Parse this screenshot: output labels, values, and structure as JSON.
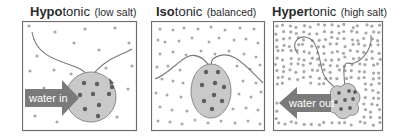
{
  "panels": [
    {
      "id": "hypotonic",
      "title_bold": "Hypo",
      "title_rest": "tonic",
      "subtitle": "(low salt)",
      "arrow_label": "water in",
      "arrow_direction": "into-cell"
    },
    {
      "id": "isotonic",
      "title_bold": "Iso",
      "title_rest": "tonic",
      "subtitle": "(balanced)",
      "arrow_label": "",
      "arrow_direction": "none"
    },
    {
      "id": "hypertonic",
      "title_bold": "Hyper",
      "title_rest": "tonic",
      "subtitle": "(high salt)",
      "arrow_label": "water out",
      "arrow_direction": "out-of-cell"
    }
  ],
  "colors": {
    "border": "#6d6d6d",
    "cell_fill": "#c9c9c9",
    "cell_stroke": "#8a8a8a",
    "salt_dot": "#a9a9a9",
    "cell_dot": "#5e5e5e",
    "arrow": "#7a7a7a",
    "arrow_text": "#ffffff"
  }
}
